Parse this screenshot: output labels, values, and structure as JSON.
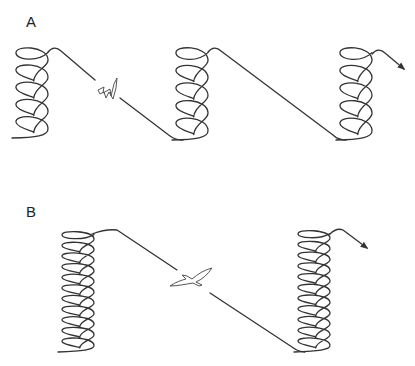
{
  "panels": [
    {
      "label": "A",
      "description": "Soaring flight: thermal circling climbs alternating with straight gliding descents",
      "coils": [
        {
          "name": "thermal-1",
          "loops": 5
        },
        {
          "name": "thermal-2",
          "loops": 5
        },
        {
          "name": "thermal-3",
          "loops": 5
        }
      ],
      "glides": 2,
      "bird": "flapping-bird-icon",
      "exit_arrow": true
    },
    {
      "label": "B",
      "description": "Soaring flight with taller thermal climbs and a single long glide",
      "coils": [
        {
          "name": "thermal-1",
          "loops": 11
        },
        {
          "name": "thermal-2",
          "loops": 11
        }
      ],
      "glides": 1,
      "bird": "gliding-bird-icon",
      "exit_arrow": true
    }
  ],
  "colors": {
    "line": "#333333",
    "bird_outline": "#555555",
    "background": "#ffffff"
  }
}
